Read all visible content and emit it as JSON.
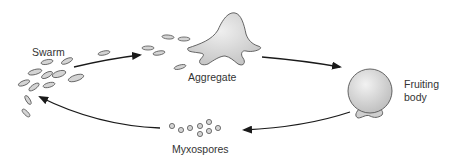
{
  "diagram": {
    "type": "life-cycle",
    "stages": [
      {
        "id": "swarm",
        "label": "Swarm"
      },
      {
        "id": "aggregate",
        "label": "Aggregate"
      },
      {
        "id": "fruiting_body",
        "label": "Fruiting body",
        "label_line1": "Fruiting",
        "label_line2": "body"
      },
      {
        "id": "myxospores",
        "label": "Myxospores"
      }
    ],
    "edges": [
      {
        "from": "swarm",
        "to": "aggregate"
      },
      {
        "from": "aggregate",
        "to": "fruiting_body"
      },
      {
        "from": "fruiting_body",
        "to": "myxospores"
      },
      {
        "from": "myxospores",
        "to": "swarm"
      }
    ],
    "colors": {
      "cell_fill": "#d4d4d4",
      "cell_stroke": "#555555",
      "arrow": "#1a1a1a",
      "label": "#333333"
    }
  }
}
